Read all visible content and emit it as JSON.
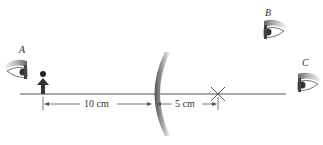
{
  "figure": {
    "type": "optics-diagram"
  },
  "labels": {
    "eye_a": "A",
    "eye_b": "B",
    "eye_c": "C"
  },
  "dimensions": {
    "object_to_mirror": "10 cm",
    "mirror_to_point": "5 cm"
  },
  "colors": {
    "line": "#555555",
    "object": "#333333",
    "mirror_dark": "#666666",
    "mirror_light": "#eeeeee",
    "text": "#333333"
  }
}
